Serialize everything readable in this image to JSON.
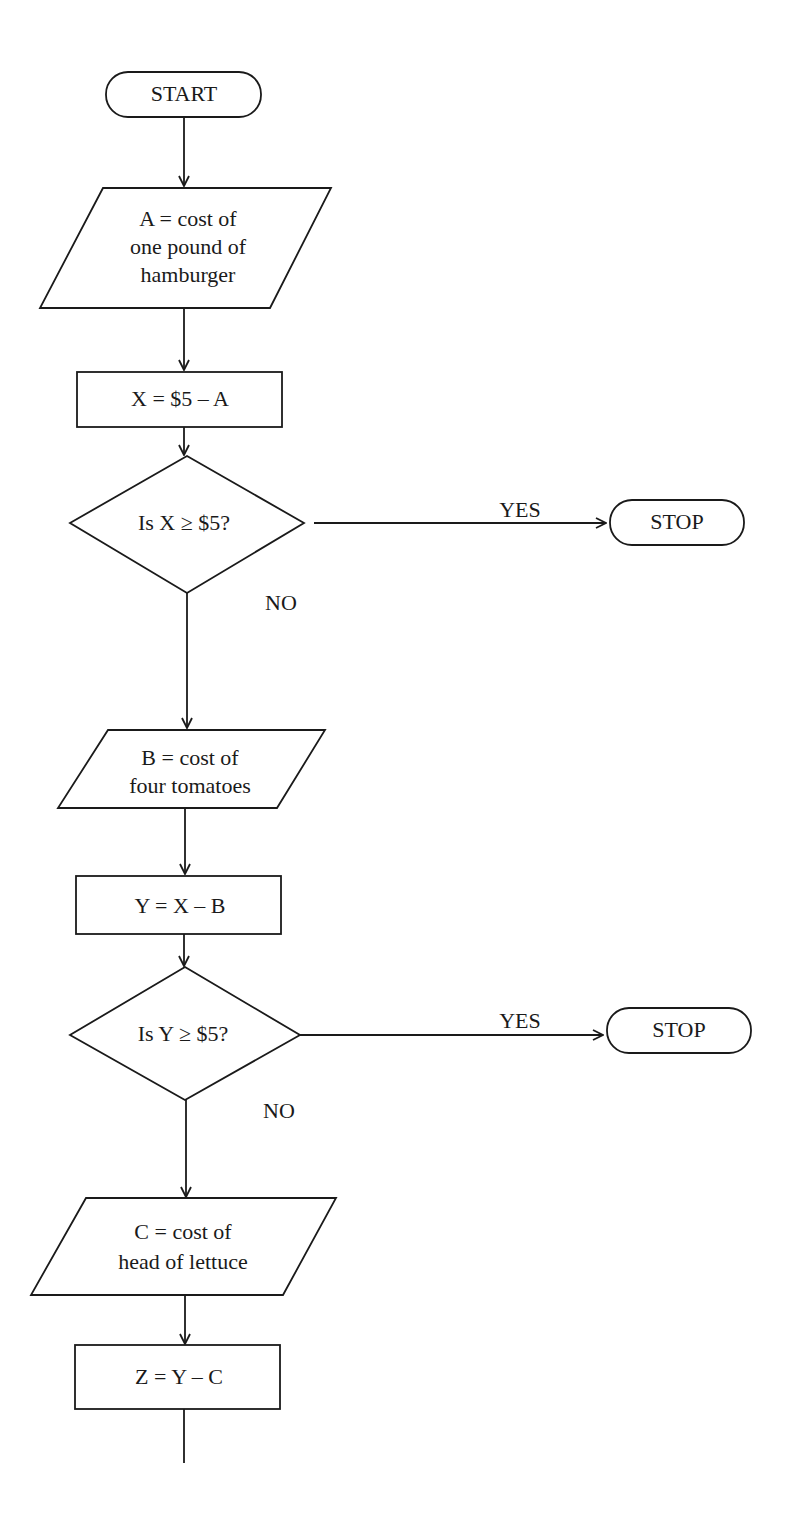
{
  "flowchart": {
    "title": "",
    "start": {
      "label": "START"
    },
    "input_a": {
      "lines": [
        "A = cost of",
        "one pound of",
        "hamburger"
      ]
    },
    "process_x": {
      "label": "X = $5 – A"
    },
    "decision_x": {
      "label": "Is X ≥ $5?",
      "yes_label": "YES",
      "no_label": "NO"
    },
    "stop_1": {
      "label": "STOP"
    },
    "input_b": {
      "lines": [
        "B = cost of",
        "four tomatoes"
      ]
    },
    "process_y": {
      "label": "Y = X – B"
    },
    "decision_y": {
      "label": "Is Y ≥ $5?",
      "yes_label": "YES",
      "no_label": "NO"
    },
    "stop_2": {
      "label": "STOP"
    },
    "input_c": {
      "lines": [
        "C = cost of",
        "head of lettuce"
      ]
    },
    "process_z": {
      "label": "Z = Y – C"
    }
  },
  "colors": {
    "stroke": "#1a1a1a",
    "background": "#ffffff"
  }
}
